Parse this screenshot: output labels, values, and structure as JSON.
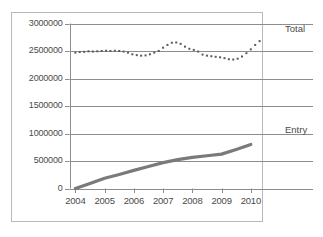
{
  "chart_data": {
    "type": "line",
    "title": "",
    "subtitle": "",
    "xlabel": "",
    "ylabel": "",
    "grid": true,
    "legend_position": "right-inline",
    "x": [
      2004,
      2005,
      2006,
      2007,
      2008,
      2009,
      2010
    ],
    "xlim": [
      2003.8,
      2010.4
    ],
    "ylim": [
      0,
      3000000
    ],
    "xtick_labels": [
      "2004",
      "2005",
      "2006",
      "2007",
      "2008",
      "2009",
      "2010"
    ],
    "ytick_labels": [
      "0",
      "500000",
      "1000000",
      "1500000",
      "2000000",
      "2500000",
      "3000000"
    ],
    "ytick_values": [
      0,
      500000,
      1000000,
      1500000,
      2000000,
      2500000,
      3000000
    ],
    "series": [
      {
        "name": "Total",
        "style": "dotted-markers",
        "color": "#5a5a5a",
        "x": [
          2004.0,
          2004.15,
          2004.3,
          2004.45,
          2004.6,
          2004.75,
          2004.9,
          2005.05,
          2005.2,
          2005.35,
          2005.5,
          2005.65,
          2005.8,
          2005.95,
          2006.1,
          2006.25,
          2006.4,
          2006.55,
          2006.7,
          2006.85,
          2007.0,
          2007.15,
          2007.3,
          2007.45,
          2007.6,
          2007.75,
          2007.9,
          2008.05,
          2008.2,
          2008.35,
          2008.5,
          2008.65,
          2008.8,
          2008.95,
          2009.1,
          2009.25,
          2009.4,
          2009.55,
          2009.7,
          2009.85,
          2010.0,
          2010.15,
          2010.3
        ],
        "values": [
          2470000,
          2480000,
          2485000,
          2495000,
          2490000,
          2495000,
          2500000,
          2505000,
          2500000,
          2505000,
          2500000,
          2490000,
          2470000,
          2440000,
          2425000,
          2415000,
          2420000,
          2440000,
          2470000,
          2500000,
          2560000,
          2610000,
          2650000,
          2655000,
          2630000,
          2580000,
          2540000,
          2520000,
          2490000,
          2435000,
          2415000,
          2405000,
          2395000,
          2385000,
          2370000,
          2350000,
          2345000,
          2360000,
          2400000,
          2460000,
          2530000,
          2610000,
          2680000
        ]
      },
      {
        "name": "Entry",
        "style": "solid-thick",
        "color": "#7a7a7a",
        "x": [
          2004,
          2004.5,
          2005,
          2005.5,
          2006,
          2006.5,
          2007,
          2007.5,
          2008,
          2008.5,
          2009,
          2009.5,
          2010
        ],
        "values": [
          0,
          90000,
          185000,
          255000,
          330000,
          400000,
          470000,
          525000,
          565000,
          595000,
          625000,
          710000,
          800000
        ]
      }
    ],
    "annotations": []
  },
  "labels": {
    "total_series_label": "Total",
    "entry_series_label": "Entry",
    "source_note": ""
  }
}
